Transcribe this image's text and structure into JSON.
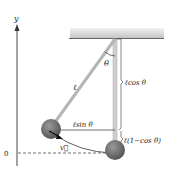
{
  "diagram": {
    "axis_label_y": "y",
    "origin_label": "0",
    "theta_label": "θ",
    "length_label": "ℓ",
    "vertical_label": "ℓcos θ",
    "horizontal_label": "ℓsin θ",
    "drop_label": "ℓ(1−cos θ)",
    "velocity_label": "v⃗",
    "caption_partial": "FIGURE 8.13",
    "colors": {
      "ceiling": "#c9c9c9",
      "rod": "#bdbdbd",
      "bob": "#707070",
      "line": "#333333"
    }
  }
}
